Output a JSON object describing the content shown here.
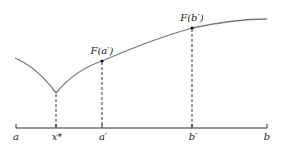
{
  "diagram": {
    "axis_labels": {
      "a": "a",
      "x_star": "x*",
      "a_prime": "a′",
      "b_prime": "b′",
      "b": "b"
    },
    "point_labels": {
      "F_a_prime": "F(a′)",
      "F_b_prime": "F(b′)"
    },
    "colors": {
      "curve": "#777777",
      "axis": "#333333",
      "text": "#222222",
      "dashed": "#333333"
    }
  }
}
